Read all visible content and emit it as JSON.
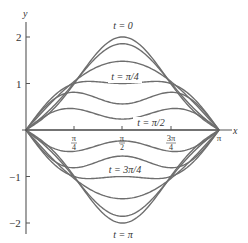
{
  "chart_data": {
    "type": "line",
    "title": "",
    "xlabel": "x",
    "ylabel": "y",
    "xlim": [
      0,
      3.14159
    ],
    "ylim": [
      -2.3,
      2.3
    ],
    "grid": false,
    "legend": "none (curves labeled inline)",
    "function": "y(x,t) = 1.707·cos(t)·sin(x) − 0.293·cos(3t)·sin(3x)",
    "x_ticks": [
      {
        "value": 0.7854,
        "label_num": "π",
        "label_den": "4"
      },
      {
        "value": 1.5708,
        "label_num": "π",
        "label_den": "2"
      },
      {
        "value": 2.3562,
        "label_num": "3π",
        "label_den": "4"
      },
      {
        "value": 3.14159,
        "label": "π"
      }
    ],
    "y_ticks": [
      {
        "value": 2,
        "label": "2"
      },
      {
        "value": 1,
        "label": "1"
      },
      {
        "value": -1,
        "label": "−1"
      },
      {
        "value": -2,
        "label": "−2"
      }
    ],
    "series": [
      {
        "name": "t = 0",
        "t": 0,
        "peak_at_pi_over_2": 2.0
      },
      {
        "name": "t = π/12",
        "t": 0.2618,
        "peak_at_pi_over_2": 1.86
      },
      {
        "name": "t = π/6",
        "t": 0.5236,
        "peak_at_pi_over_2": 1.48
      },
      {
        "name": "t = π/4",
        "t": 0.7854,
        "peak_at_pi_over_2": 1.0
      },
      {
        "name": "t = π/3",
        "t": 1.0472,
        "peak_at_pi_over_2": 0.56
      },
      {
        "name": "t = 5π/12",
        "t": 1.309,
        "peak_at_pi_over_2": 0.24
      },
      {
        "name": "t = π/2",
        "t": 1.5708,
        "peak_at_pi_over_2": 0.0
      },
      {
        "name": "t = 7π/12",
        "t": 1.8326,
        "peak_at_pi_over_2": -0.24
      },
      {
        "name": "t = 2π/3",
        "t": 2.0944,
        "peak_at_pi_over_2": -0.56
      },
      {
        "name": "t = 3π/4",
        "t": 2.3562,
        "peak_at_pi_over_2": -1.0
      },
      {
        "name": "t = 5π/6",
        "t": 2.618,
        "peak_at_pi_over_2": -1.48
      },
      {
        "name": "t = 11π/12",
        "t": 2.8798,
        "peak_at_pi_over_2": -1.86
      },
      {
        "name": "t = π",
        "t": 3.14159,
        "peak_at_pi_over_2": -2.0
      }
    ],
    "coefficients": {
      "A": 1.707,
      "B": -0.293
    },
    "annotations": [
      {
        "text": "t = 0",
        "x": 1.5708,
        "y": 2.15
      },
      {
        "text": "t = π/4",
        "x": 1.5708,
        "y": 1.12
      },
      {
        "text": "t = π/2",
        "x": 1.75,
        "y": 0.1
      },
      {
        "text": "t = 3π/4",
        "x": 1.5708,
        "y": -0.88
      },
      {
        "text": "t = π",
        "x": 1.5708,
        "y": -2.25
      }
    ]
  },
  "labels": {
    "x_axis": "x",
    "y_axis": "y",
    "t0": "t = 0",
    "t_pi4": "t = π/4",
    "t_pi2": "t = π/2",
    "t_3pi4": "t = 3π/4",
    "t_pi": "t = π",
    "y2": "2",
    "y1": "1",
    "ym1": "−1",
    "ym2": "−2",
    "xt_pi4_num": "π",
    "xt_pi4_den": "4",
    "xt_pi2_num": "π",
    "xt_pi2_den": "2",
    "xt_3pi4_num": "3π",
    "xt_3pi4_den": "4",
    "xt_pi": "π"
  },
  "style": {
    "curve_color": "#6e6e6e",
    "axis_color": "#555555"
  }
}
